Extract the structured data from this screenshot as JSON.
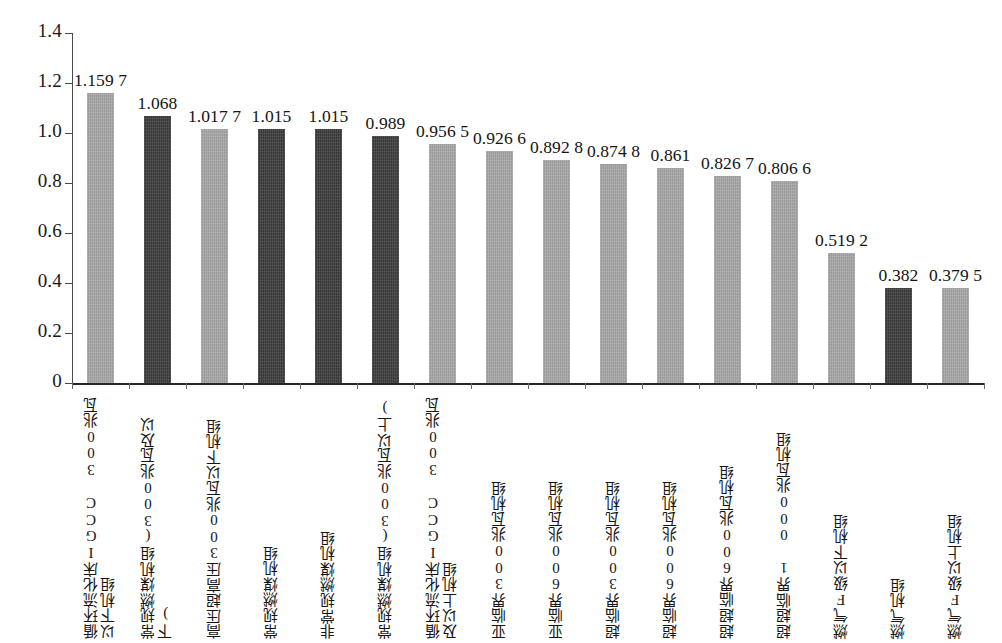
{
  "chart_data": {
    "type": "bar",
    "title": "",
    "subtitle": "",
    "xlabel": "",
    "ylabel": "",
    "ylim": [
      0,
      1.4
    ],
    "ytick_labels": [
      "1.4",
      "1.2",
      "1.0",
      "0.8",
      "0.6",
      "0.4",
      "0.2",
      "0"
    ],
    "ytick_values": [
      1.4,
      1.2,
      1.0,
      0.8,
      0.6,
      0.4,
      0.2,
      0
    ],
    "grid": false,
    "legend": null,
    "bar_colors": {
      "light": "#a6a6a6",
      "dark": "#3b3b3b"
    },
    "categories": [
      "循环流化床IGCC 300兆瓦\n以下机组",
      "常规燃煤机组(300兆瓦及以下)",
      "高压超高压300兆瓦以下机组",
      "常规燃煤机组",
      "非常规燃煤机组",
      "常规燃煤机组(300兆瓦以上)",
      "循环流化床IGCC 300兆瓦\n及以上机组",
      "亚临界300兆瓦机组",
      "亚临界600兆瓦机组",
      "超临界300兆瓦机组",
      "超临界600兆瓦机组",
      "超超临界600兆瓦机组",
      "超超临界1 000兆瓦机组",
      "燃气F级以下机组",
      "燃气机组",
      "燃气F级以上机组"
    ],
    "values": [
      1.1597,
      1.068,
      1.0177,
      1.015,
      1.015,
      0.989,
      0.9565,
      0.9266,
      0.8928,
      0.8748,
      0.861,
      0.8267,
      0.8066,
      0.5192,
      0.382,
      0.3795
    ],
    "value_labels": [
      "1.159 7",
      "1.068",
      "1.017 7",
      "1.015",
      "1.015",
      "0.989",
      "0.956 5",
      "0.926 6",
      "0.892 8",
      "0.874 8",
      "0.861",
      "0.826 7",
      "0.806 6",
      "0.519 2",
      "0.382",
      "0.379 5"
    ],
    "shades": [
      "light",
      "dark",
      "light",
      "dark",
      "dark",
      "dark",
      "light",
      "light",
      "light",
      "light",
      "light",
      "light",
      "light",
      "light",
      "dark",
      "light"
    ]
  }
}
